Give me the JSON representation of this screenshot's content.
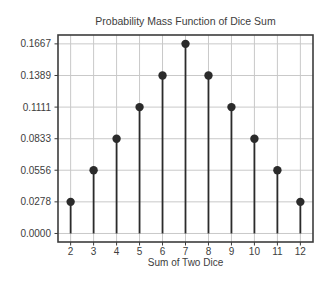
{
  "chart_data": {
    "type": "stem",
    "title": "Probability Mass Function of Dice Sum",
    "xlabel": "Sum of Two Dice",
    "ylabel": "",
    "x": [
      2,
      3,
      4,
      5,
      6,
      7,
      8,
      9,
      10,
      11,
      12
    ],
    "values": [
      0.0278,
      0.0556,
      0.0833,
      0.1111,
      0.1389,
      0.1667,
      0.1389,
      0.1111,
      0.0833,
      0.0556,
      0.0278
    ],
    "xtick_labels": [
      "2",
      "3",
      "4",
      "5",
      "6",
      "7",
      "8",
      "9",
      "10",
      "11",
      "12"
    ],
    "ytick_values": [
      0.0,
      0.0278,
      0.0556,
      0.0833,
      0.1111,
      0.1389,
      0.1667
    ],
    "ytick_labels": [
      "0.0000",
      "0.0278",
      "0.0556",
      "0.0833",
      "0.1111",
      "0.1389",
      "0.1667"
    ],
    "xlim": [
      1.45,
      12.55
    ],
    "ylim": [
      -0.0075,
      0.1745
    ],
    "baseline_value": 0.0,
    "grid": true,
    "legend": null,
    "colors": {
      "stem": "#2b2b2b",
      "marker": "#2b2b2b",
      "grid": "#c9c9c9",
      "axis_border": "#3c3c3c",
      "tick_mark": "#3c3c3c",
      "text": "#3d3d3d",
      "background": "#ffffff"
    }
  }
}
